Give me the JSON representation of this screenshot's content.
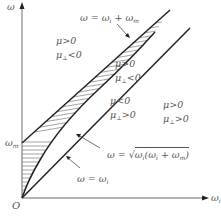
{
  "axes": {
    "y_label": "ω",
    "x_label": "ω",
    "x_label_sub": "i",
    "origin_label": "O",
    "y_tick_label": "ω",
    "y_tick_sub": "m"
  },
  "curves": {
    "upper_line": {
      "lhs": "ω = ω",
      "sub1": "i",
      "mid": " + ω",
      "sub2": "m"
    },
    "diagonal_line": {
      "lhs": "ω = ω",
      "sub1": "i"
    },
    "sqrt_curve": {
      "lhs": "ω = ",
      "radicand": "ω",
      "sub1": "i",
      "mid": "(ω",
      "sub2": "i",
      "mid2": " + ω",
      "sub3": "m",
      "end": ")"
    }
  },
  "regions": {
    "top_left": {
      "line1": "μ>0",
      "line2_pre": "μ",
      "line2_sub": "⊥",
      "line2_post": "<0"
    },
    "band_upper": {
      "line1": "μ>0",
      "line2_pre": "μ",
      "line2_sub": "⊥",
      "line2_post": "<0"
    },
    "band_lower": {
      "line1": "μ<0",
      "line2_pre": "μ",
      "line2_sub": "⊥",
      "line2_post": ">0"
    },
    "right": {
      "line1": "μ>0",
      "line2_pre": "μ",
      "line2_sub": "⊥",
      "line2_post": ">0"
    }
  },
  "colors": {
    "line": "#222222",
    "axis": "#444444",
    "hatch": "#555555",
    "text": "#555555"
  }
}
